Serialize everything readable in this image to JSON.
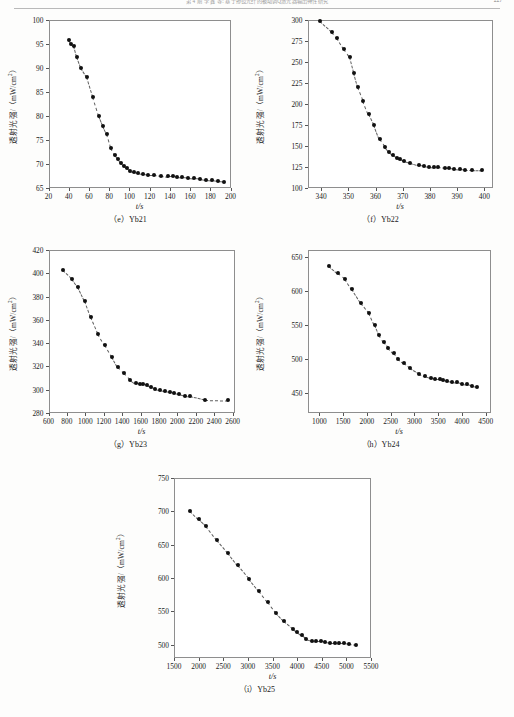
{
  "header": {
    "running_title": "第 4 期        李 鑫 等: 基于掺镱光纤的被动调Q激光器输出特性研究",
    "page_number": "227"
  },
  "axis_labels": {
    "x_title": "t/s",
    "y_title_prefix": "透射光强/（mW/cm",
    "y_title_sup": "2",
    "y_title_suffix": "）"
  },
  "chart_data": [
    {
      "id": "e",
      "type": "scatter",
      "caption": "（e）Yb21",
      "title": "",
      "xlabel": "t/s",
      "ylabel": "透射光强/（mW/cm2）",
      "xlim": [
        20,
        200
      ],
      "ylim": [
        65,
        100
      ],
      "xticks": [
        20,
        40,
        60,
        80,
        100,
        120,
        140,
        160,
        180,
        200
      ],
      "yticks": [
        65,
        70,
        75,
        80,
        85,
        90,
        95,
        100
      ],
      "grid": false,
      "legend": false,
      "x": [
        40,
        42,
        45,
        48,
        52,
        58,
        64,
        70,
        74,
        78,
        82,
        86,
        89,
        92,
        95,
        98,
        101,
        105,
        109,
        113,
        118,
        124,
        131,
        138,
        143,
        147,
        152,
        158,
        164,
        170,
        176,
        182,
        188,
        194
      ],
      "y": [
        95.8,
        95.1,
        94.5,
        92.2,
        90.0,
        88.1,
        84.0,
        80.0,
        78.0,
        76.2,
        73.4,
        71.8,
        71.0,
        70.2,
        69.6,
        69.1,
        68.6,
        68.3,
        68.1,
        67.9,
        67.8,
        67.8,
        67.6,
        67.4,
        67.4,
        67.3,
        67.2,
        67.1,
        67.0,
        66.9,
        66.7,
        66.6,
        66.4,
        66.3
      ]
    },
    {
      "id": "f",
      "type": "scatter",
      "caption": "（f）Yb22",
      "title": "",
      "xlabel": "t/s",
      "ylabel": "透射光强/（mW/cm2）",
      "xlim": [
        335,
        403
      ],
      "ylim": [
        100,
        300
      ],
      "xticks": [
        340,
        350,
        360,
        370,
        380,
        390,
        400
      ],
      "yticks": [
        100,
        125,
        150,
        175,
        200,
        225,
        250,
        275,
        300
      ],
      "grid": false,
      "legend": false,
      "x": [
        339.5,
        344,
        346,
        348.5,
        350.5,
        352,
        353.5,
        355.5,
        357.5,
        359.5,
        361.5,
        363.5,
        365,
        366.5,
        368,
        369,
        370.5,
        372.5,
        376,
        378,
        379.5,
        381.5,
        383,
        385.5,
        387,
        389,
        391,
        393,
        395.5,
        399
      ],
      "y": [
        299,
        286,
        278,
        265,
        256,
        237.5,
        220,
        204,
        188,
        175,
        158,
        149,
        143,
        139,
        136,
        134,
        132,
        130,
        127,
        126.5,
        125.5,
        125,
        124.5,
        123.5,
        123.5,
        123,
        122.5,
        122,
        122,
        121.5
      ]
    },
    {
      "id": "g",
      "type": "scatter",
      "caption": "（g）Yb23",
      "title": "",
      "xlabel": "t/s",
      "ylabel": "透射光强/（mW/cm2）",
      "xlim": [
        600,
        2620
      ],
      "ylim": [
        280,
        420
      ],
      "xticks": [
        600,
        800,
        1000,
        1200,
        1400,
        1600,
        1800,
        2000,
        2200,
        2400,
        2600
      ],
      "yticks": [
        280,
        300,
        320,
        340,
        360,
        380,
        400,
        420
      ],
      "grid": false,
      "legend": false,
      "x": [
        760,
        855,
        925,
        995,
        1060,
        1140,
        1215,
        1290,
        1350,
        1420,
        1490,
        1545,
        1590,
        1625,
        1665,
        1715,
        1760,
        1810,
        1860,
        1915,
        1965,
        2020,
        2080,
        2140,
        2300,
        2545
      ],
      "y": [
        402.5,
        395.5,
        388,
        376.5,
        362.5,
        348,
        338,
        328,
        319.5,
        314,
        308.5,
        305.5,
        305,
        304.5,
        304,
        302,
        301,
        300,
        299,
        298,
        297.5,
        296.5,
        295,
        294.5,
        291.5,
        291
      ]
    },
    {
      "id": "h",
      "type": "scatter",
      "caption": "（h）Yb24",
      "title": "",
      "xlabel": "t/s",
      "ylabel": "透射光强/（mW/cm2）",
      "xlim": [
        750,
        4600
      ],
      "ylim": [
        420,
        660
      ],
      "xticks": [
        1000,
        1500,
        2000,
        2500,
        3000,
        3500,
        4000,
        4500
      ],
      "yticks": [
        450,
        500,
        550,
        600,
        650
      ],
      "grid": false,
      "legend": false,
      "x": [
        1210,
        1390,
        1540,
        1690,
        1870,
        2050,
        2160,
        2250,
        2350,
        2450,
        2560,
        2660,
        2770,
        2900,
        3090,
        3230,
        3340,
        3440,
        3540,
        3610,
        3680,
        3790,
        3890,
        3990,
        4110,
        4210,
        4310
      ],
      "y": [
        637,
        626,
        618,
        602,
        582,
        567,
        550,
        535,
        524,
        516,
        508,
        499,
        493,
        486,
        478,
        474,
        471,
        470,
        470,
        468,
        467,
        466,
        465,
        463,
        462,
        460,
        459
      ]
    },
    {
      "id": "i",
      "type": "scatter",
      "caption": "（i）Yb25",
      "title": "",
      "xlabel": "t/s",
      "ylabel": "透射光强/（mW/cm2）",
      "xlim": [
        1500,
        5500
      ],
      "ylim": [
        480,
        750
      ],
      "xticks": [
        1500,
        2000,
        2500,
        3000,
        3500,
        4000,
        4500,
        5000,
        5500
      ],
      "yticks": [
        500,
        550,
        600,
        650,
        700,
        750
      ],
      "grid": false,
      "legend": false,
      "x": [
        1830,
        2010,
        2150,
        2370,
        2590,
        2790,
        3020,
        3220,
        3400,
        3570,
        3730,
        3910,
        4000,
        4090,
        4180,
        4300,
        4390,
        4480,
        4570,
        4660,
        4760,
        4860,
        4950,
        5050,
        5190
      ],
      "y": [
        701,
        688,
        678,
        657,
        638,
        619,
        599,
        581,
        564,
        547,
        535,
        524,
        519,
        514,
        509,
        506,
        505,
        505,
        504,
        503,
        503,
        502,
        502,
        501,
        500
      ]
    }
  ]
}
